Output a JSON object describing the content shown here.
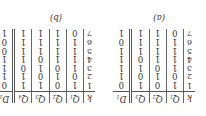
{
  "tables": [
    {
      "caption": "(a)",
      "headers": [
        {
          "base": "k",
          "sub": ""
        },
        {
          "base": "Q",
          "sub": "1"
        },
        {
          "base": "Q",
          "sub": "2"
        },
        {
          "base": "Q",
          "sub": "3"
        },
        {
          "base": "D",
          "sub": "1"
        }
      ],
      "rows": [
        [
          "1",
          "1",
          "0",
          "1",
          "0"
        ],
        [
          "2",
          "0",
          "1",
          "0",
          "1"
        ],
        [
          "3",
          "1",
          "0",
          "1",
          "1"
        ],
        [
          "4",
          "1",
          "1",
          "0",
          "1"
        ],
        [
          "5",
          "1",
          "1",
          "1",
          "1"
        ],
        [
          "6",
          "1",
          "1",
          "1",
          "0"
        ],
        [
          "7",
          "0",
          "1",
          "1",
          "1"
        ]
      ]
    },
    {
      "caption": "(b)",
      "headers": [
        {
          "base": "k",
          "sub": ""
        },
        {
          "base": "Q",
          "sub": "1"
        },
        {
          "base": "Q",
          "sub": "2"
        },
        {
          "base": "Q",
          "sub": "3"
        },
        {
          "base": "Q",
          "sub": "4"
        },
        {
          "base": "D",
          "sub": "1"
        }
      ],
      "rows": [
        [
          "1",
          "1",
          "0",
          "1",
          "1",
          "0"
        ],
        [
          "2",
          "0",
          "1",
          "0",
          "1",
          "1"
        ],
        [
          "3",
          "1",
          "0",
          "1",
          "0",
          "1"
        ],
        [
          "4",
          "1",
          "1",
          "0",
          "1",
          "1"
        ],
        [
          "5",
          "1",
          "1",
          "1",
          "1",
          "0"
        ],
        [
          "6",
          "1",
          "1",
          "1",
          "1",
          "0"
        ],
        [
          "7",
          "0",
          "1",
          "1",
          "1",
          "1"
        ]
      ]
    }
  ],
  "orientation": "rotated 180 degrees"
}
